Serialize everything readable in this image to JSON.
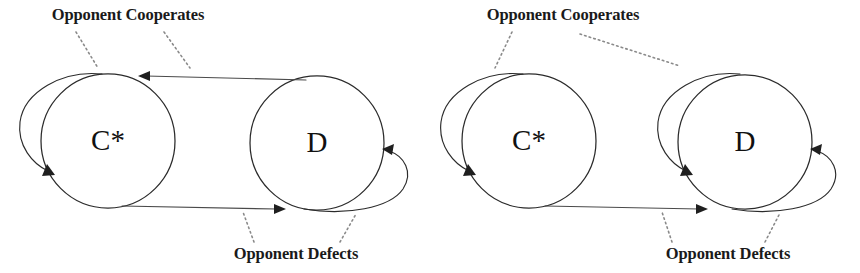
{
  "figure": {
    "background_color": "#ffffff",
    "stroke_color": "#2b2b2b",
    "leader_color": "#8a8a8a",
    "text_color": "#1a1a1a"
  },
  "diagrams": [
    {
      "id": "left",
      "name": "tit-for-tat-automaton",
      "states": [
        {
          "id": "c-star",
          "label": "C*",
          "cx": 108,
          "cy": 141,
          "r": 67,
          "start_state": true
        },
        {
          "id": "d",
          "label": "D",
          "cx": 317,
          "cy": 143,
          "r": 67,
          "start_state": false
        }
      ],
      "transitions": [
        {
          "id": "c-to-c",
          "from": "c-star",
          "to": "c-star",
          "type": "self-loop",
          "side": "left",
          "trigger": "Opponent Cooperates"
        },
        {
          "id": "c-to-d",
          "from": "c-star",
          "to": "d",
          "type": "edge",
          "position": "bottom",
          "direction": "right",
          "trigger": "Opponent Defects"
        },
        {
          "id": "d-to-c",
          "from": "d",
          "to": "c-star",
          "type": "edge",
          "position": "top",
          "direction": "left",
          "trigger": "Opponent Cooperates"
        },
        {
          "id": "d-to-d",
          "from": "d",
          "to": "d",
          "type": "self-loop",
          "side": "right",
          "trigger": "Opponent Defects"
        }
      ],
      "annotations": [
        {
          "id": "top-label",
          "text": "Opponent Cooperates",
          "x": 128,
          "y": 20
        },
        {
          "id": "bottom-label",
          "text": "Opponent Defects",
          "x": 296,
          "y": 259
        }
      ]
    },
    {
      "id": "right",
      "name": "grim-trigger-automaton",
      "states": [
        {
          "id": "c-star",
          "label": "C*",
          "cx": 529,
          "cy": 141,
          "r": 67,
          "start_state": true
        },
        {
          "id": "d",
          "label": "D",
          "cx": 745,
          "cy": 142,
          "r": 67,
          "start_state": false
        }
      ],
      "transitions": [
        {
          "id": "c-to-c",
          "from": "c-star",
          "to": "c-star",
          "type": "self-loop",
          "side": "left",
          "trigger": "Opponent Cooperates"
        },
        {
          "id": "c-to-d",
          "from": "c-star",
          "to": "d",
          "type": "edge",
          "position": "bottom",
          "direction": "right",
          "trigger": "Opponent Defects"
        },
        {
          "id": "d-to-d-left",
          "from": "d",
          "to": "d",
          "type": "self-loop",
          "side": "left",
          "trigger": "Opponent Cooperates"
        },
        {
          "id": "d-to-d-right",
          "from": "d",
          "to": "d",
          "type": "self-loop",
          "side": "right",
          "trigger": "Opponent Defects"
        }
      ],
      "annotations": [
        {
          "id": "top-label",
          "text": "Opponent Cooperates",
          "x": 563,
          "y": 20
        },
        {
          "id": "bottom-label",
          "text": "Opponent Defects",
          "x": 728,
          "y": 259
        }
      ]
    }
  ]
}
